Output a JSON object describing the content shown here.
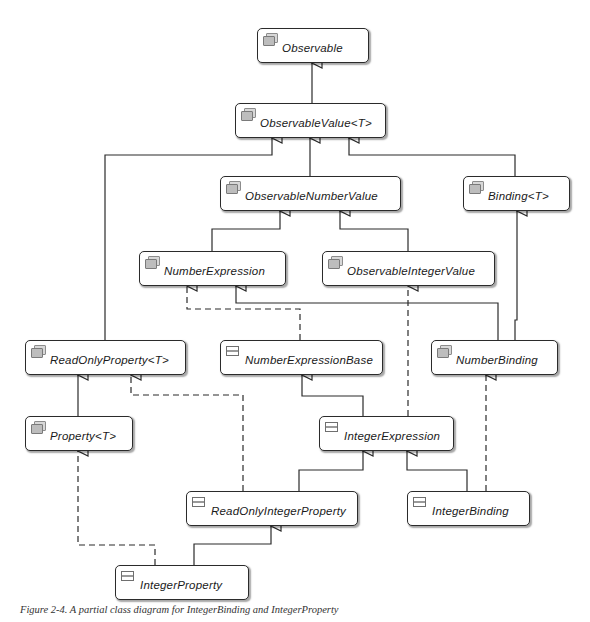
{
  "diagram": {
    "type": "uml-class-diagram",
    "caption": "Figure 2-4. A partial class diagram for IntegerBinding and IntegerProperty",
    "nodes": {
      "observable": {
        "label": "Observable",
        "kind": "interface",
        "icon": "interface-icon"
      },
      "observable_value": {
        "label": "ObservableValue<T>",
        "kind": "interface",
        "icon": "interface-icon"
      },
      "observable_number_value": {
        "label": "ObservableNumberValue",
        "kind": "interface",
        "icon": "interface-icon"
      },
      "binding": {
        "label": "Binding<T>",
        "kind": "interface",
        "icon": "interface-icon"
      },
      "number_expression": {
        "label": "NumberExpression",
        "kind": "interface",
        "icon": "interface-icon"
      },
      "observable_integer_value": {
        "label": "ObservableIntegerValue",
        "kind": "interface",
        "icon": "interface-icon"
      },
      "read_only_property": {
        "label": "ReadOnlyProperty<T>",
        "kind": "interface",
        "icon": "interface-icon"
      },
      "number_expression_base": {
        "label": "NumberExpressionBase",
        "kind": "class",
        "icon": "class-icon"
      },
      "number_binding": {
        "label": "NumberBinding",
        "kind": "interface",
        "icon": "interface-icon"
      },
      "property": {
        "label": "Property<T>",
        "kind": "interface",
        "icon": "interface-icon"
      },
      "integer_expression": {
        "label": "IntegerExpression",
        "kind": "class",
        "icon": "class-icon"
      },
      "read_only_integer_property": {
        "label": "ReadOnlyIntegerProperty",
        "kind": "class",
        "icon": "class-icon"
      },
      "integer_binding": {
        "label": "IntegerBinding",
        "kind": "class",
        "icon": "class-icon"
      },
      "integer_property": {
        "label": "IntegerProperty",
        "kind": "class",
        "icon": "class-icon"
      }
    },
    "edges": [
      {
        "from": "ObservableValue<T>",
        "to": "Observable",
        "type": "generalization"
      },
      {
        "from": "ObservableNumberValue",
        "to": "ObservableValue<T>",
        "type": "generalization"
      },
      {
        "from": "ReadOnlyProperty<T>",
        "to": "ObservableValue<T>",
        "type": "generalization"
      },
      {
        "from": "Binding<T>",
        "to": "ObservableValue<T>",
        "type": "generalization"
      },
      {
        "from": "NumberExpression",
        "to": "ObservableNumberValue",
        "type": "generalization"
      },
      {
        "from": "ObservableIntegerValue",
        "to": "ObservableNumberValue",
        "type": "generalization"
      },
      {
        "from": "NumberExpressionBase",
        "to": "NumberExpression",
        "type": "realization"
      },
      {
        "from": "NumberBinding",
        "to": "NumberExpression",
        "type": "generalization"
      },
      {
        "from": "NumberBinding",
        "to": "Binding<T>",
        "type": "generalization"
      },
      {
        "from": "Property<T>",
        "to": "ReadOnlyProperty<T>",
        "type": "generalization"
      },
      {
        "from": "IntegerExpression",
        "to": "NumberExpressionBase",
        "type": "generalization"
      },
      {
        "from": "IntegerExpression",
        "to": "ObservableIntegerValue",
        "type": "realization"
      },
      {
        "from": "ReadOnlyIntegerProperty",
        "to": "ReadOnlyProperty<T>",
        "type": "realization"
      },
      {
        "from": "ReadOnlyIntegerProperty",
        "to": "IntegerExpression",
        "type": "generalization"
      },
      {
        "from": "IntegerBinding",
        "to": "IntegerExpression",
        "type": "generalization"
      },
      {
        "from": "IntegerBinding",
        "to": "NumberBinding",
        "type": "realization"
      },
      {
        "from": "IntegerProperty",
        "to": "ReadOnlyIntegerProperty",
        "type": "generalization"
      },
      {
        "from": "IntegerProperty",
        "to": "Property<T>",
        "type": "realization"
      }
    ],
    "colors": {
      "line": "#2b2b2b",
      "node_border": "#2b2b2b",
      "icon_fill": "#bdbdbd",
      "background": "#ffffff"
    }
  }
}
